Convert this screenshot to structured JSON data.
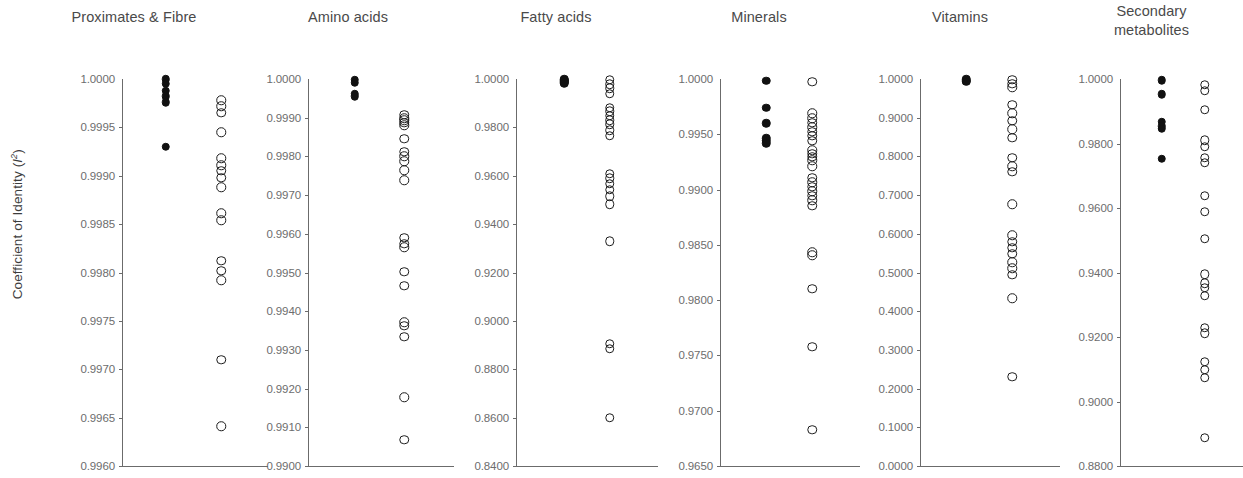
{
  "figure": {
    "y_axis_label_text": "Coefficient of Identity (I2)",
    "y_axis_label_main": "Coefficient of Identity (",
    "y_axis_label_var": "I",
    "y_axis_label_sup": "2",
    "y_axis_label_close": ")",
    "marker_colors": {
      "closed": "#111111",
      "open_stroke": "#1b1b1b",
      "axis": "#6b6b6b",
      "text": "#5a5a5a"
    }
  },
  "chart_data": [
    {
      "type": "scatter",
      "title": "Proximates & Fibre",
      "xlabel": "",
      "ylabel": "Coefficient of Identity (I2)",
      "ylim": [
        0.996,
        1.0
      ],
      "ytick_labels": [
        "1.0000",
        "0.9995",
        "0.9990",
        "0.9985",
        "0.9980",
        "0.9975",
        "0.9970",
        "0.9965",
        "0.9960"
      ],
      "yticks": [
        1.0,
        0.9995,
        0.999,
        0.9985,
        0.998,
        0.9975,
        0.997,
        0.9965,
        0.996
      ],
      "grid": false,
      "legend": "none",
      "series": [
        {
          "name": "closed",
          "marker": "filled-circle",
          "x": 1,
          "values": [
            1.0,
            0.99995,
            0.99988,
            0.99982,
            0.99976,
            0.9993
          ]
        },
        {
          "name": "open",
          "marker": "open-circle",
          "x": 2,
          "values": [
            0.99978,
            0.99972,
            0.99965,
            0.99945,
            0.99918,
            0.99911,
            0.99905,
            0.99898,
            0.99888,
            0.99861,
            0.99854,
            0.99812,
            0.99802,
            0.99792,
            0.9971,
            0.99641
          ]
        }
      ]
    },
    {
      "type": "scatter",
      "title": "Amino acids",
      "xlabel": "",
      "ylabel": "",
      "ylim": [
        0.99,
        1.0
      ],
      "ytick_labels": [
        "1.0000",
        "0.9990",
        "0.9980",
        "0.9970",
        "0.9960",
        "0.9950",
        "0.9940",
        "0.9930",
        "0.9920",
        "0.9910",
        "0.9900"
      ],
      "yticks": [
        1.0,
        0.999,
        0.998,
        0.997,
        0.996,
        0.995,
        0.994,
        0.993,
        0.992,
        0.991,
        0.99
      ],
      "grid": false,
      "legend": "none",
      "series": [
        {
          "name": "closed",
          "marker": "filled-circle",
          "x": 1,
          "values": [
            0.99998,
            0.9999,
            0.99962,
            0.99955
          ]
        },
        {
          "name": "open",
          "marker": "open-circle",
          "x": 2,
          "values": [
            0.99908,
            0.99898,
            0.99893,
            0.99887,
            0.9988,
            0.99845,
            0.99812,
            0.998,
            0.99788,
            0.99764,
            0.99739,
            0.9959,
            0.99574,
            0.99565,
            0.99502,
            0.99466,
            0.99372,
            0.99362,
            0.99334,
            0.99178,
            0.99068
          ]
        }
      ]
    },
    {
      "type": "scatter",
      "title": "Fatty acids",
      "xlabel": "",
      "ylabel": "",
      "ylim": [
        0.84,
        1.0
      ],
      "ytick_labels": [
        "1.0000",
        "0.9800",
        "0.9600",
        "0.9400",
        "0.9200",
        "0.9000",
        "0.8800",
        "0.8600",
        "0.8400"
      ],
      "yticks": [
        1.0,
        0.98,
        0.96,
        0.94,
        0.92,
        0.9,
        0.88,
        0.86,
        0.84
      ],
      "grid": false,
      "legend": "none",
      "series": [
        {
          "name": "closed",
          "marker": "filled-circle",
          "x": 1,
          "values": [
            0.9998,
            0.9994,
            0.999,
            0.9986,
            0.9982
          ]
        },
        {
          "name": "open",
          "marker": "open-circle",
          "x": 2,
          "values": [
            0.9996,
            0.9978,
            0.9962,
            0.9938,
            0.9882,
            0.9866,
            0.9848,
            0.983,
            0.9812,
            0.9788,
            0.9766,
            0.9608,
            0.959,
            0.9566,
            0.9542,
            0.9516,
            0.9482,
            0.933,
            0.8906,
            0.8884,
            0.86
          ]
        }
      ]
    },
    {
      "type": "scatter",
      "title": "Minerals",
      "xlabel": "",
      "ylabel": "",
      "ylim": [
        0.965,
        1.0
      ],
      "ytick_labels": [
        "1.0000",
        "0.9950",
        "0.9900",
        "0.9850",
        "0.9800",
        "0.9750",
        "0.9700",
        "0.9650"
      ],
      "yticks": [
        1.0,
        0.995,
        0.99,
        0.985,
        0.98,
        0.975,
        0.97,
        0.965
      ],
      "grid": false,
      "legend": "none",
      "series": [
        {
          "name": "closed",
          "marker": "filled-circle",
          "x": 1,
          "values": [
            0.99985,
            0.9974,
            0.996,
            0.99465,
            0.9944,
            0.9942
          ]
        },
        {
          "name": "open",
          "marker": "open-circle",
          "x": 2,
          "values": [
            0.99975,
            0.9969,
            0.99645,
            0.99605,
            0.99565,
            0.99525,
            0.99485,
            0.9944,
            0.99355,
            0.99325,
            0.99295,
            0.99265,
            0.9921,
            0.99105,
            0.99065,
            0.99025,
            0.98985,
            0.98945,
            0.98905,
            0.98855,
            0.98435,
            0.98405,
            0.98105,
            0.9758,
            0.9683
          ]
        }
      ]
    },
    {
      "type": "scatter",
      "title": "Vitamins",
      "xlabel": "",
      "ylabel": "",
      "ylim": [
        0.0,
        1.0
      ],
      "ytick_labels": [
        "1.0000",
        "0.9000",
        "0.8000",
        "0.7000",
        "0.6000",
        "0.5000",
        "0.4000",
        "0.3000",
        "0.2000",
        "0.1000",
        "0.0000"
      ],
      "yticks": [
        1.0,
        0.9,
        0.8,
        0.7,
        0.6,
        0.5,
        0.4,
        0.3,
        0.2,
        0.1,
        0.0
      ],
      "grid": false,
      "legend": "none",
      "series": [
        {
          "name": "closed",
          "marker": "filled-circle",
          "x": 1,
          "values": [
            0.999,
            0.996,
            0.993
          ]
        },
        {
          "name": "open",
          "marker": "open-circle",
          "x": 2,
          "values": [
            0.998,
            0.988,
            0.979,
            0.933,
            0.912,
            0.892,
            0.87,
            0.848,
            0.796,
            0.774,
            0.76,
            0.676,
            0.596,
            0.58,
            0.564,
            0.549,
            0.527,
            0.511,
            0.494,
            0.434,
            0.23
          ]
        }
      ]
    },
    {
      "type": "scatter",
      "title": "Secondary metabolites",
      "title_line1": "Secondary",
      "title_line2": "metabolites",
      "xlabel": "",
      "ylabel": "",
      "ylim": [
        0.88,
        1.0
      ],
      "ytick_labels": [
        "1.0000",
        "0.9800",
        "0.9600",
        "0.9400",
        "0.9200",
        "0.9000",
        "0.8800"
      ],
      "yticks": [
        1.0,
        0.98,
        0.96,
        0.94,
        0.92,
        0.9,
        0.88
      ],
      "grid": false,
      "legend": "none",
      "series": [
        {
          "name": "closed",
          "marker": "filled-circle",
          "x": 1,
          "values": [
            0.9996,
            0.9952,
            0.9868,
            0.9854,
            0.9846,
            0.9752
          ]
        },
        {
          "name": "open",
          "marker": "open-circle",
          "x": 2,
          "values": [
            0.9982,
            0.9964,
            0.9904,
            0.981,
            0.979,
            0.9756,
            0.974,
            0.9638,
            0.9588,
            0.9504,
            0.9394,
            0.9366,
            0.9352,
            0.9328,
            0.9228,
            0.9212,
            0.9124,
            0.9098,
            0.9074,
            0.8888
          ]
        }
      ]
    }
  ]
}
